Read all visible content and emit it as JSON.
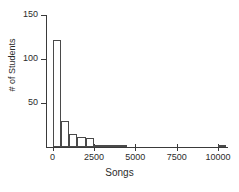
{
  "chart_data": {
    "type": "bar",
    "title": "",
    "subtitle": "",
    "xlabel": "Songs",
    "ylabel": "# of Students",
    "xlim": [
      -400,
      10600
    ],
    "ylim": [
      0,
      150
    ],
    "grid": false,
    "legend": null,
    "bin_width": 500,
    "x_ticks": [
      0,
      2500,
      5000,
      7500,
      10000
    ],
    "x_tick_labels": [
      "0",
      "2500",
      "5000",
      "7500",
      "10000"
    ],
    "y_ticks": [
      50,
      100,
      150
    ],
    "y_tick_labels": [
      "50",
      "100",
      "150"
    ],
    "bins": [
      {
        "x0": 0,
        "x1": 500,
        "value": 122
      },
      {
        "x0": 500,
        "x1": 1000,
        "value": 30
      },
      {
        "x0": 1000,
        "x1": 1500,
        "value": 15
      },
      {
        "x0": 1500,
        "x1": 2000,
        "value": 11
      },
      {
        "x0": 2000,
        "x1": 2500,
        "value": 10
      },
      {
        "x0": 2500,
        "x1": 3000,
        "value": 2
      },
      {
        "x0": 3000,
        "x1": 3500,
        "value": 2
      },
      {
        "x0": 3500,
        "x1": 4000,
        "value": 1
      },
      {
        "x0": 4000,
        "x1": 4500,
        "value": 1
      },
      {
        "x0": 10000,
        "x1": 10500,
        "value": 1
      }
    ],
    "categories": [
      "0-500",
      "500-1000",
      "1000-1500",
      "1500-2000",
      "2000-2500",
      "2500-3000",
      "3000-3500",
      "3500-4000",
      "4000-4500",
      "10000-10500"
    ],
    "values": [
      122,
      30,
      15,
      11,
      10,
      2,
      2,
      1,
      1,
      1
    ],
    "colors": {
      "bar_fill": "#ffffff",
      "bar_edge": "#4a4a4a",
      "axis": "#3a3a3a",
      "text": "#2b2b2b",
      "background": "#ffffff"
    }
  }
}
